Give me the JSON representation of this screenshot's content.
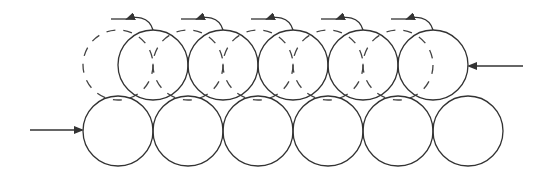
{
  "diagram": {
    "colors": {
      "stroke": "#333333",
      "background": "#ffffff"
    },
    "radius": 35,
    "bottom_row": {
      "y": 131,
      "x": [
        118,
        188,
        258,
        328,
        398,
        468
      ]
    },
    "top_row": {
      "y": 65,
      "x": [
        153,
        223,
        293,
        363,
        433
      ]
    },
    "ghost_row": {
      "y": 65,
      "x": [
        118,
        188,
        258,
        328,
        398
      ]
    },
    "arrows": {
      "left_force": {
        "x1": 30,
        "y1": 130,
        "x2": 82,
        "y2": 130,
        "direction": "right"
      },
      "right_force": {
        "x1": 523,
        "y1": 66,
        "x2": 469,
        "y2": 66,
        "direction": "left"
      }
    }
  }
}
